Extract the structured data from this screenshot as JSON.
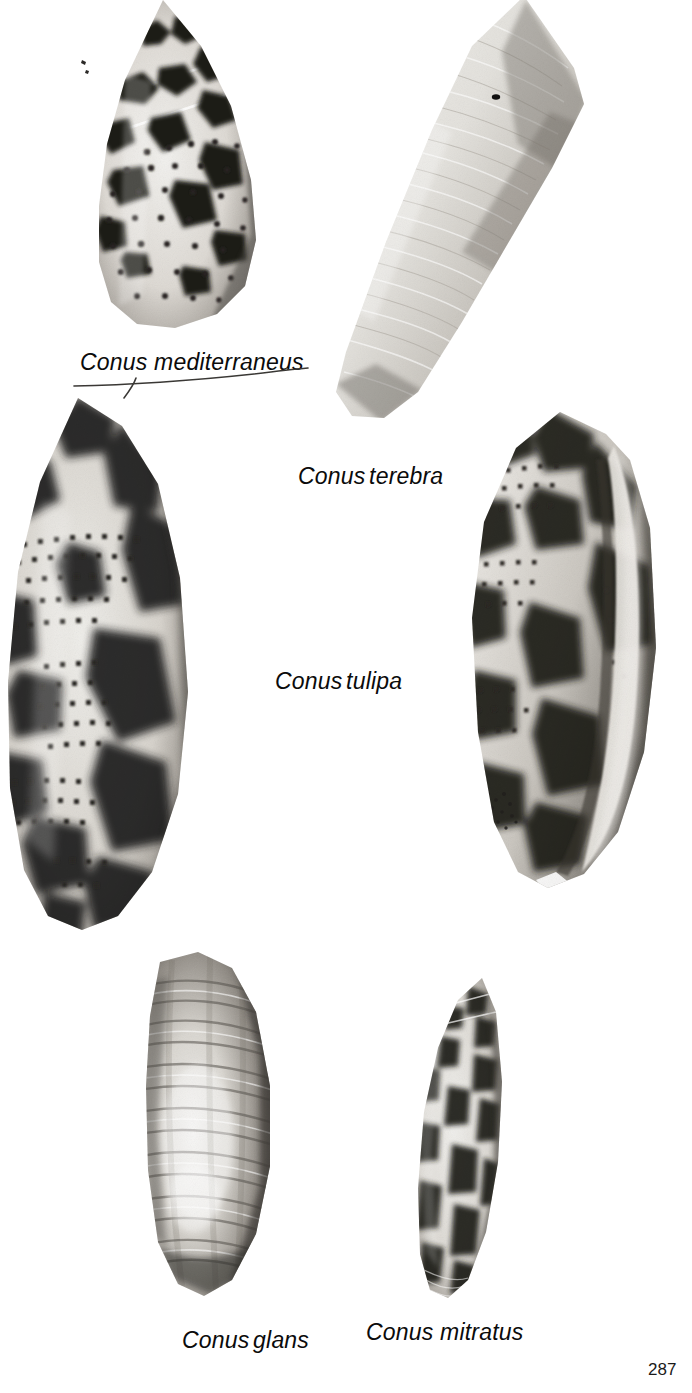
{
  "page": {
    "width": 692,
    "height": 1393,
    "background": "#ffffff",
    "page_number": "287",
    "ink_color": "#0b0b0b"
  },
  "plate": {
    "kind": "photographic-plate",
    "subject": "cone shells (genus Conus)",
    "rendering": "black-and-white halftone photographs on white ground",
    "specimen_count": 6
  },
  "captions": [
    {
      "id": "caption-mediterraneus",
      "text": "Conus mediterraneus",
      "x": 80,
      "y": 349,
      "underlined": true,
      "spacing": "normal"
    },
    {
      "id": "caption-terebra",
      "text": "Conus terebra",
      "x": 298,
      "y": 463,
      "underlined": false,
      "spacing": "tight"
    },
    {
      "id": "caption-tulipa",
      "text": "Conus tulipa",
      "x": 275,
      "y": 668,
      "underlined": false,
      "spacing": "tight"
    },
    {
      "id": "caption-glans",
      "text": "Conus glans",
      "x": 182,
      "y": 1327,
      "underlined": false,
      "spacing": "tight"
    },
    {
      "id": "caption-mitratus",
      "text": "Conus mitratus",
      "x": 366,
      "y": 1319,
      "underlined": false,
      "spacing": "normal"
    }
  ],
  "specimens": [
    {
      "id": "shell-conus-mediterraneus",
      "species": "Conus mediterraneus",
      "position": "top-left",
      "view": "dorsal",
      "cropped_by_frame": "top",
      "pattern": "dark irregular blotches with rows of fine dark dots",
      "tone": "light ground, bold dark markings",
      "bounds": {
        "x": 55,
        "y": 0,
        "w": 215,
        "h": 330
      }
    },
    {
      "id": "shell-conus-terebra",
      "species": "Conus terebra",
      "position": "top-right",
      "view": "dorsal",
      "cropped_by_frame": "top",
      "pattern": "plain, fine spiral striations, one small dark speck",
      "tone": "pale uniform grey-white",
      "bounds": {
        "x": 315,
        "y": 0,
        "w": 275,
        "h": 440
      }
    },
    {
      "id": "shell-conus-tulipa-left",
      "species": "Conus tulipa",
      "position": "middle-left",
      "view": "dorsal",
      "cropped_by_frame": "left",
      "pattern": "cloudy dark blotches over grids of small square dots",
      "tone": "high contrast",
      "bounds": {
        "x": 0,
        "y": 396,
        "w": 200,
        "h": 535
      }
    },
    {
      "id": "shell-conus-tulipa-right",
      "species": "Conus tulipa",
      "position": "middle-right",
      "view": "apertural",
      "cropped_by_frame": "none",
      "pattern": "dark blotches with long pale aperture slit at right",
      "tone": "high contrast",
      "bounds": {
        "x": 448,
        "y": 408,
        "w": 222,
        "h": 478
      }
    },
    {
      "id": "shell-conus-glans",
      "species": "Conus glans",
      "position": "bottom-left",
      "view": "dorsal",
      "cropped_by_frame": "none",
      "pattern": "fine horizontal ribbing, dark margins, bright central highlight",
      "tone": "mid grey",
      "bounds": {
        "x": 128,
        "y": 952,
        "w": 168,
        "h": 345
      }
    },
    {
      "id": "shell-conus-mitratus",
      "species": "Conus mitratus",
      "position": "bottom-right",
      "view": "dorsal",
      "cropped_by_frame": "none",
      "pattern": "bold rectangular dark blotches in vertical columns",
      "tone": "pale ground, dark blocks",
      "bounds": {
        "x": 400,
        "y": 978,
        "w": 122,
        "h": 320
      }
    }
  ]
}
